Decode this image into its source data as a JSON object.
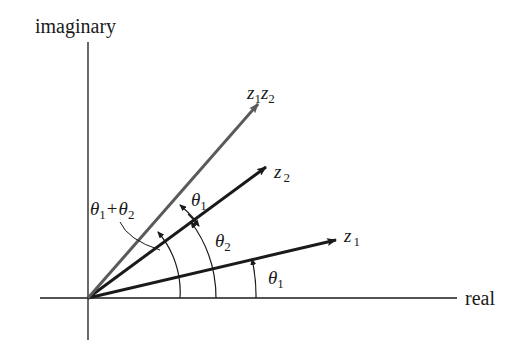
{
  "axes": {
    "vertical_label": "imaginary",
    "horizontal_label": "real"
  },
  "vectors": [
    {
      "name": "z1",
      "label_base": "z",
      "label_sub": "1"
    },
    {
      "name": "z2",
      "label_base": "z",
      "label_sub": "2"
    },
    {
      "name": "z1z2",
      "label_parts": [
        "z",
        "1",
        "z",
        "2"
      ]
    }
  ],
  "angles": {
    "theta1_z1": {
      "base": "θ",
      "sub": "1"
    },
    "theta2": {
      "base": "θ",
      "sub": "2"
    },
    "theta1_between": {
      "base": "θ",
      "sub": "1"
    },
    "sum": {
      "a": "θ",
      "a_sub": "1",
      "op": "+",
      "b": "θ",
      "b_sub": "2"
    }
  },
  "colors": {
    "ink": "#1a1a1a",
    "product_vector": "#5a5a5a"
  }
}
